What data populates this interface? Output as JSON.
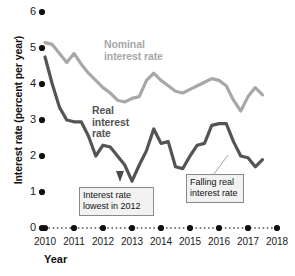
{
  "chart_data": {
    "type": "line",
    "title": "",
    "xlabel": "Year",
    "ylabel": "Interest rate (percent per year)",
    "xlim": [
      2010,
      2018
    ],
    "ylim": [
      0,
      6
    ],
    "ytick_labels": [
      "0",
      "1",
      "2",
      "3",
      "4",
      "5",
      "6"
    ],
    "ytick_values": [
      0,
      1,
      2,
      3,
      4,
      5,
      6
    ],
    "xtick_labels": [
      "2010",
      "2011",
      "2012",
      "2013",
      "2014",
      "2015",
      "2016",
      "2017",
      "2018"
    ],
    "xtick_values": [
      2010,
      2011,
      2012,
      2013,
      2014,
      2015,
      2016,
      2017,
      2018
    ],
    "grid": false,
    "legend_position": "inline-annotation",
    "series": [
      {
        "name": "Nominal interest rate",
        "color": "#a8a8a8",
        "x": [
          2010.0,
          2010.25,
          2010.5,
          2010.75,
          2011.0,
          2011.25,
          2011.5,
          2011.75,
          2012.0,
          2012.25,
          2012.5,
          2012.75,
          2013.0,
          2013.25,
          2013.5,
          2013.75,
          2014.0,
          2014.25,
          2014.5,
          2014.75,
          2015.0,
          2015.25,
          2015.5,
          2015.75,
          2016.0,
          2016.25,
          2016.5,
          2016.75,
          2017.0,
          2017.25,
          2017.5
        ],
        "values": [
          5.15,
          5.1,
          4.85,
          4.6,
          4.85,
          4.55,
          4.3,
          4.1,
          3.9,
          3.75,
          3.55,
          3.5,
          3.6,
          3.65,
          4.1,
          4.3,
          4.1,
          3.95,
          3.8,
          3.75,
          3.85,
          3.95,
          4.05,
          4.15,
          4.1,
          3.95,
          3.55,
          3.25,
          3.65,
          3.9,
          3.7
        ]
      },
      {
        "name": "Real interest rate",
        "color": "#545454",
        "x": [
          2010.0,
          2010.25,
          2010.5,
          2010.75,
          2011.0,
          2011.25,
          2011.5,
          2011.75,
          2012.0,
          2012.25,
          2012.5,
          2012.75,
          2013.0,
          2013.25,
          2013.5,
          2013.75,
          2014.0,
          2014.25,
          2014.5,
          2014.75,
          2015.0,
          2015.25,
          2015.5,
          2015.75,
          2016.0,
          2016.25,
          2016.5,
          2016.75,
          2017.0,
          2017.25,
          2017.5
        ],
        "values": [
          4.75,
          4.0,
          3.35,
          3.0,
          2.95,
          2.95,
          2.55,
          2.0,
          2.3,
          2.25,
          2.0,
          1.75,
          1.3,
          1.75,
          2.15,
          2.75,
          2.35,
          2.4,
          1.7,
          1.65,
          2.0,
          2.3,
          2.35,
          2.85,
          2.9,
          2.9,
          2.4,
          2.0,
          1.95,
          1.7,
          1.9
        ]
      }
    ],
    "annotations": [
      {
        "id": "lowest",
        "text_lines": [
          "Interest rate",
          "lowest in 2012"
        ],
        "points_to_x": 2013,
        "points_to_y": 1.3,
        "marker": "up-arrow"
      },
      {
        "id": "falling",
        "text_lines": [
          "Falling real",
          "interest rate"
        ],
        "points_to_x": 2016.4,
        "points_to_y": 2.45,
        "marker": "leader-line"
      }
    ]
  }
}
